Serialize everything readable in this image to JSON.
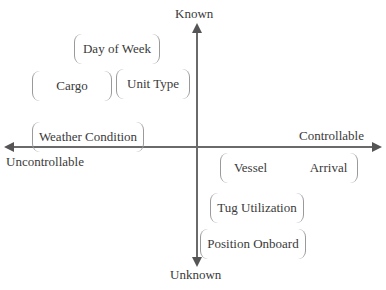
{
  "diagram": {
    "type": "quadrant",
    "axes": {
      "vertical": {
        "top": "Known",
        "bottom": "Unknown"
      },
      "horizontal": {
        "left": "Uncontrollable",
        "right": "Controllable"
      }
    },
    "items": [
      {
        "label": "Day of Week",
        "quadrant": "known-uncontrollable"
      },
      {
        "label": "Cargo",
        "quadrant": "known-uncontrollable"
      },
      {
        "label": "Unit Type",
        "quadrant": "known-uncontrollable"
      },
      {
        "label": "Weather Condition",
        "quadrant": "known-uncontrollable"
      },
      {
        "label": "Vessel",
        "quadrant": "unknown-controllable"
      },
      {
        "label": "Arrival",
        "quadrant": "unknown-controllable"
      },
      {
        "label": "Tug Utilization",
        "quadrant": "unknown-controllable"
      },
      {
        "label": "Position Onboard",
        "quadrant": "unknown-controllable"
      }
    ],
    "colors": {
      "axis": "#6a6a6a",
      "bracket": "#9a9a9a",
      "text": "#3a3a3a"
    }
  }
}
